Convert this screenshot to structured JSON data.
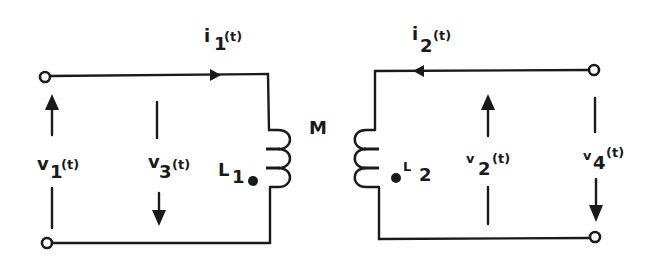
{
  "diagram": {
    "type": "coupled-inductor circuit (transformer)",
    "mutual_label": "M",
    "primary": {
      "inductor": {
        "symbol": "L",
        "subscript": "1",
        "dot_mark": "bottom"
      },
      "current": {
        "symbol": "i",
        "subscript": "1",
        "arg": "(t)",
        "direction": "right (into coil)"
      },
      "voltages": [
        {
          "symbol": "v",
          "subscript": "1",
          "arg": "(t)",
          "direction": "up"
        },
        {
          "symbol": "v",
          "subscript": "3",
          "arg": "(t)",
          "direction": "down"
        }
      ]
    },
    "secondary": {
      "inductor": {
        "symbol": "L",
        "subscript": "2",
        "dot_mark": "bottom"
      },
      "current": {
        "symbol": "i",
        "subscript": "2",
        "arg": "(t)",
        "direction": "left (into coil)"
      },
      "voltages": [
        {
          "symbol": "v",
          "subscript": "2",
          "arg": "(t)",
          "direction": "up"
        },
        {
          "symbol": "v",
          "subscript": "4",
          "arg": "(t)",
          "direction": "down"
        }
      ]
    },
    "colors": {
      "ink": "#1a1a1a",
      "background": "#ffffff"
    }
  }
}
